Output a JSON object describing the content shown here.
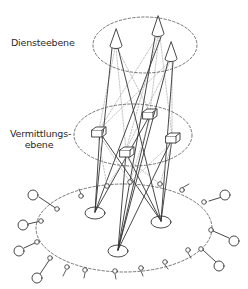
{
  "labels": {
    "service_layer": "Diensteebene",
    "switching_layer_line1": "Vermittlungs-",
    "switching_layer_line2": "ebene"
  },
  "diagram": {
    "layers": [
      {
        "name": "Diensteebene",
        "nodes": 3,
        "node_shape": "cone"
      },
      {
        "name": "Vermittlungsebene",
        "nodes": 4,
        "node_shape": "box"
      },
      {
        "name": "access-ring",
        "hubs": 3,
        "ring_nodes": 19,
        "end_devices": 9
      }
    ],
    "colors": {
      "stroke": "#333333",
      "dashed": "#555555",
      "light": "#999999"
    }
  }
}
